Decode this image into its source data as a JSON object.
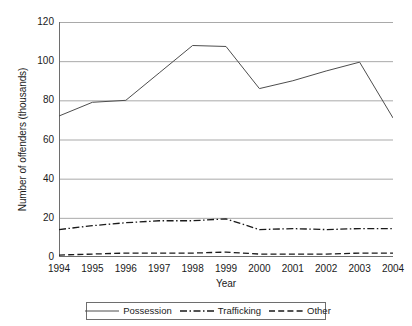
{
  "chart_data": {
    "type": "line",
    "title": "",
    "xlabel": "Year",
    "ylabel": "Number of offenders (thousands)",
    "x": [
      1994,
      1995,
      1996,
      1997,
      1998,
      1999,
      2000,
      2001,
      2002,
      2003,
      2004
    ],
    "categories": [
      "1994",
      "1995",
      "1996",
      "1997",
      "1998",
      "1999",
      "2000",
      "2001",
      "2002",
      "2003",
      "2004"
    ],
    "xlim": [
      1994,
      2004
    ],
    "ylim": [
      0,
      120
    ],
    "yticks": [
      0,
      20,
      40,
      60,
      80,
      100,
      120
    ],
    "ytick_labels": [
      "0",
      "20",
      "40",
      "60",
      "80",
      "100",
      "120"
    ],
    "grid": "horizontal",
    "legend_position": "bottom",
    "series": [
      {
        "name": "Possession",
        "style": "solid",
        "color": "#4d4d4d",
        "values": [
          72,
          79,
          80,
          94,
          108,
          107.5,
          86,
          90,
          95,
          99.5,
          71
        ]
      },
      {
        "name": "Trafficking",
        "style": "dash-dot",
        "color": "#1a1a1a",
        "values": [
          14,
          16,
          17.5,
          18.5,
          18.5,
          19.5,
          14,
          14.5,
          14,
          14.5,
          14.5
        ]
      },
      {
        "name": "Other",
        "style": "dashed",
        "color": "#1a1a1a",
        "values": [
          1,
          1.5,
          2,
          2,
          2,
          2.5,
          1.5,
          1.5,
          1.5,
          2,
          2
        ]
      }
    ]
  },
  "axes": {
    "y_title": "Number of offenders (thousands)",
    "x_title": "Year",
    "y_tick_labels": [
      "120",
      "100",
      "80",
      "60",
      "40",
      "20",
      "0"
    ],
    "x_tick_labels": [
      "1994",
      "1995",
      "1996",
      "1997",
      "1998",
      "1999",
      "2000",
      "2001",
      "2002",
      "2003",
      "2004"
    ]
  },
  "legend": {
    "items": [
      {
        "label": "Possession",
        "style": "solid"
      },
      {
        "label": "Trafficking",
        "style": "dash-dot"
      },
      {
        "label": "Other",
        "style": "dashed"
      }
    ]
  },
  "colors": {
    "possession": "#4d4d4d",
    "trafficking": "#1a1a1a",
    "other": "#1a1a1a",
    "gridline": "#a9a9a9",
    "axis": "#6e6e6e",
    "background": "#ffffff",
    "text": "#1a1a1a"
  }
}
